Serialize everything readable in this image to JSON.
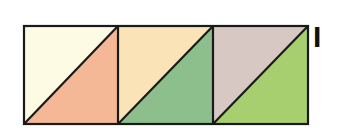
{
  "figure": {
    "label": "I",
    "squares": [
      {
        "upper_color": "#fefbe4",
        "lower_color": "#f4b897"
      },
      {
        "upper_color": "#fbe3b8",
        "lower_color": "#8dbf8c"
      },
      {
        "upper_color": "#d7c8c3",
        "lower_color": "#a8cf6f"
      }
    ],
    "stroke_color": "#1a1a1a"
  }
}
